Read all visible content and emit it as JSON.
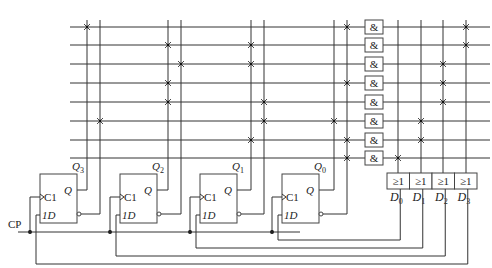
{
  "diagram": {
    "type": "circuit-schematic",
    "clock_label": "CP",
    "flip_flops": [
      {
        "id": "ff3",
        "output_label": "Q3",
        "q_label": "Q",
        "clk_label": "C1",
        "d_label": "1D",
        "x": 40,
        "col_q": 87,
        "col_qn": 100,
        "feedback_y": 264,
        "feedback_from": "D3"
      },
      {
        "id": "ff2",
        "output_label": "Q2",
        "q_label": "Q",
        "clk_label": "C1",
        "d_label": "1D",
        "x": 120,
        "col_q": 168,
        "col_qn": 181,
        "feedback_y": 256,
        "feedback_from": "D2"
      },
      {
        "id": "ff1",
        "output_label": "Q1",
        "q_label": "Q",
        "clk_label": "C1",
        "d_label": "1D",
        "x": 200,
        "col_q": 251,
        "col_qn": 264,
        "feedback_y": 248,
        "feedback_from": "D1"
      },
      {
        "id": "ff0",
        "output_label": "Q0",
        "q_label": "Q",
        "clk_label": "C1",
        "d_label": "1D",
        "x": 282,
        "col_q": 334,
        "col_qn": 347,
        "feedback_y": 240,
        "feedback_from": "D0"
      }
    ],
    "rows_y": [
      27,
      45,
      64,
      83,
      102,
      121,
      140,
      158
    ],
    "and_gates": {
      "label": "&",
      "count": 8
    },
    "or_gates": [
      {
        "label": "≥1",
        "output": "D0",
        "col": 398
      },
      {
        "label": "≥1",
        "output": "D1",
        "col": 421
      },
      {
        "label": "≥1",
        "output": "D2",
        "col": 443
      },
      {
        "label": "≥1",
        "output": "D3",
        "col": 466
      }
    ],
    "and_array_connections": [
      [
        87,
        347
      ],
      [
        168,
        251
      ],
      [
        181,
        251
      ],
      [
        168,
        347
      ],
      [
        168,
        264
      ],
      [
        100,
        264,
        334
      ],
      [
        251,
        347
      ],
      [
        347
      ]
    ],
    "or_array_connections": [
      [
        466
      ],
      [
        466
      ],
      [
        443
      ],
      [
        443
      ],
      [
        443
      ],
      [
        421
      ],
      [
        421
      ],
      [
        398
      ]
    ]
  }
}
